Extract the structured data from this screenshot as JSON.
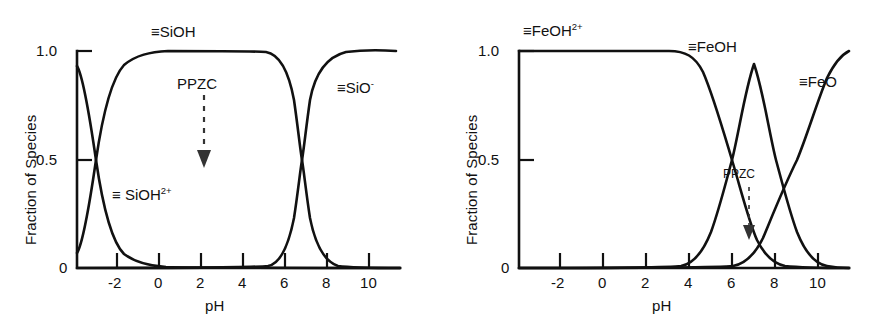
{
  "figure": {
    "background": "#ffffff",
    "line_color": "#111111"
  },
  "chart_data": [
    {
      "type": "line",
      "panel": "left",
      "title": "",
      "xlabel": "pH",
      "ylabel": "Fraction of Species",
      "xlim": [
        -4.2,
        11.5
      ],
      "ylim": [
        0,
        1.08
      ],
      "xticks": [
        -2,
        0,
        2,
        4,
        6,
        8,
        10
      ],
      "xticklabels": [
        "-2",
        "0",
        "2",
        "4",
        "6",
        "8",
        "10"
      ],
      "yticks": [
        0,
        0.5,
        1.0
      ],
      "yticklabels": [
        "0",
        "0.5",
        "1.0"
      ],
      "grid": false,
      "legend": "inline-annotations",
      "annotations": [
        {
          "text": "PPZC",
          "x": 2.0,
          "y": 0.88,
          "arrow_to_y": 0.5
        }
      ],
      "series": [
        {
          "name": "≡SiOH2+",
          "label_html": "≡ SiOH<sup>2+</sup>",
          "label_x": 0.1,
          "label_y": 0.33,
          "model": "logistic_decreasing",
          "pK": -3.0,
          "slope": 1.15,
          "x": [
            -4.2,
            -4.0,
            -3.5,
            -3.0,
            -2.5,
            -2.0,
            -1.5,
            -1.0,
            -0.5,
            0.0,
            0.5,
            1.0,
            2.0,
            3.0,
            4.0,
            6.0,
            8.0,
            10.0,
            11.5
          ],
          "values": [
            0.93,
            0.91,
            0.76,
            0.5,
            0.24,
            0.1,
            0.04,
            0.016,
            0.007,
            0.003,
            0.001,
            0.0005,
            0.0,
            0.0,
            0.0,
            0.0,
            0.0,
            0.0,
            0.0
          ]
        },
        {
          "name": "≡SiOH",
          "label_html": "≡SiOH",
          "label_x": 1.0,
          "label_y": 1.13,
          "model": "difference_of_logistics",
          "pK1": -3.0,
          "pK2": 6.8,
          "x": [
            -4.2,
            -4.0,
            -3.5,
            -3.0,
            -2.5,
            -2.0,
            -1.5,
            -1.0,
            0.0,
            2.0,
            4.0,
            5.0,
            6.0,
            6.4,
            6.8,
            7.2,
            8.0,
            9.0,
            10.0,
            11.0,
            11.5
          ],
          "values": [
            0.07,
            0.09,
            0.24,
            0.5,
            0.76,
            0.9,
            0.96,
            0.984,
            0.997,
            1.0,
            1.0,
            0.99,
            0.93,
            0.8,
            0.5,
            0.22,
            0.05,
            0.012,
            0.004,
            0.001,
            0.0
          ]
        },
        {
          "name": "≡SiO-",
          "label_html": "≡SiO<sup>-</sup>",
          "label_x": 8.3,
          "label_y": 0.82,
          "model": "logistic_increasing",
          "pK": 6.8,
          "slope": 1.15,
          "x": [
            -4.2,
            0.0,
            4.0,
            5.0,
            6.0,
            6.4,
            6.8,
            7.2,
            8.0,
            9.0,
            10.0,
            11.0,
            11.5
          ],
          "values": [
            0.0,
            0.0,
            0.0,
            0.01,
            0.07,
            0.2,
            0.5,
            0.78,
            0.95,
            0.988,
            0.996,
            0.999,
            1.0
          ]
        }
      ]
    },
    {
      "type": "line",
      "panel": "right",
      "title": "",
      "xlabel": "pH",
      "ylabel": "Fraction of Species",
      "xlim": [
        -4.2,
        11.8
      ],
      "ylim": [
        0,
        1.08
      ],
      "xticks": [
        -2,
        0,
        2,
        4,
        6,
        8,
        10
      ],
      "xticklabels": [
        "-2",
        "0",
        "2",
        "4",
        "6",
        "8",
        "10"
      ],
      "yticks": [
        0,
        0.5,
        1.0
      ],
      "yticklabels": [
        "0",
        "0.5",
        "1.0"
      ],
      "grid": false,
      "legend": "inline-annotations",
      "annotations": [
        {
          "text": "PPZC",
          "x": 7.5,
          "y": 0.42,
          "arrow_to_y": 0.12
        }
      ],
      "series": [
        {
          "name": "≡FeOH2+",
          "label_html": "≡FeOH<sup>2+</sup>",
          "label_x": -0.6,
          "label_y": 1.13,
          "model": "logistic_decreasing",
          "pK": 6.0,
          "slope": 1.05,
          "x": [
            -4.2,
            -2.0,
            0.0,
            2.0,
            3.0,
            4.0,
            4.5,
            5.0,
            5.5,
            6.0,
            6.5,
            7.0,
            7.5,
            8.0,
            9.0,
            10.0,
            11.0,
            11.8
          ],
          "values": [
            1.0,
            1.0,
            1.0,
            0.998,
            0.995,
            0.985,
            0.96,
            0.9,
            0.74,
            0.47,
            0.24,
            0.1,
            0.04,
            0.015,
            0.002,
            0.0,
            0.0,
            0.0
          ]
        },
        {
          "name": "≡FeOH",
          "label_html": "≡FeOH",
          "label_x": 7.2,
          "label_y": 1.03,
          "model": "difference_of_logistics",
          "pK1": 6.0,
          "pK2": 9.0,
          "peak_x": 7.5,
          "peak_y": 0.93,
          "x": [
            -4.2,
            0.0,
            3.0,
            4.0,
            4.5,
            5.0,
            5.5,
            6.0,
            6.5,
            7.0,
            7.5,
            8.0,
            8.5,
            9.0,
            9.5,
            10.0,
            10.5,
            11.0,
            11.8
          ],
          "values": [
            0.0,
            0.0,
            0.004,
            0.012,
            0.03,
            0.09,
            0.25,
            0.45,
            0.72,
            0.88,
            0.93,
            0.88,
            0.72,
            0.45,
            0.24,
            0.1,
            0.04,
            0.015,
            0.003
          ]
        },
        {
          "name": "≡FeO",
          "label_html": "≡FeO",
          "label_x": 9.9,
          "label_y": 0.8,
          "model": "logistic_increasing",
          "pK": 9.0,
          "slope": 1.05,
          "x": [
            -4.2,
            0.0,
            4.0,
            6.0,
            7.0,
            7.5,
            8.0,
            8.5,
            9.0,
            9.5,
            10.0,
            10.5,
            11.0,
            11.8
          ],
          "values": [
            0.0,
            0.0,
            0.0,
            0.003,
            0.02,
            0.04,
            0.1,
            0.26,
            0.5,
            0.74,
            0.89,
            0.96,
            0.985,
            1.0
          ]
        }
      ]
    }
  ]
}
